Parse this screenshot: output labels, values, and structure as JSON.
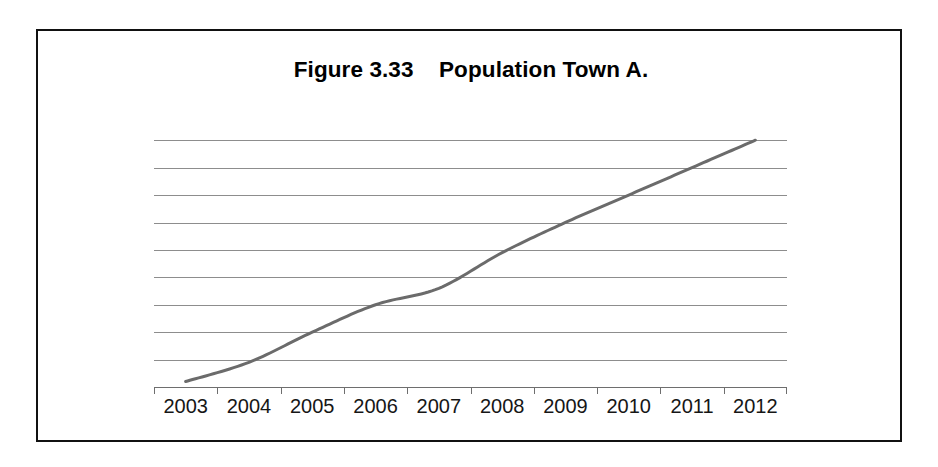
{
  "figure": {
    "title": "Figure 3.33    Population Town A.",
    "frame_color": "#111111",
    "background": "#ffffff"
  },
  "chart_data": {
    "type": "line",
    "title": "Figure 3.33    Population Town A.",
    "xlabel": "",
    "ylabel": "",
    "categories": [
      "2003",
      "2004",
      "2005",
      "2006",
      "2007",
      "2008",
      "2009",
      "2010",
      "2011",
      "2012"
    ],
    "x": [
      2003,
      2004,
      2005,
      2006,
      2007,
      2008,
      2009,
      2010,
      2011,
      2012
    ],
    "series": [
      {
        "name": "Population Town A",
        "color": "#6b6b6b",
        "values": [
          0.2,
          0.9,
          2.0,
          3.0,
          3.6,
          4.9,
          6.0,
          7.0,
          8.0,
          9.0
        ]
      }
    ],
    "ylim": [
      0,
      9.7
    ],
    "yticks": [
      1,
      2,
      3,
      4,
      5,
      6,
      7,
      8,
      9
    ],
    "ytick_labels": [],
    "grid": true,
    "grid_color": "#8d8d8d",
    "legend": false,
    "legend_position": "none",
    "axis_color": "#6e6e6e",
    "line_width": 3
  }
}
